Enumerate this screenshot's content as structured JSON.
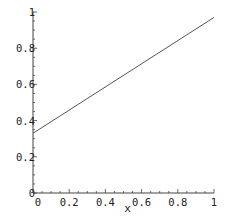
{
  "chart_data": {
    "type": "line",
    "title": "",
    "xlabel": "x",
    "ylabel": "",
    "xlim": [
      0,
      1
    ],
    "ylim": [
      0,
      1
    ],
    "grid": false,
    "legend": null,
    "x_ticks": [
      "0",
      "0.2",
      "0.4",
      "0.6",
      "0.8",
      "1"
    ],
    "y_ticks": [
      "0",
      "0.2",
      "0.4",
      "0.6",
      "0.8",
      "1"
    ],
    "series": [
      {
        "name": "line",
        "x": [
          0,
          1
        ],
        "y": [
          0.33,
          0.97
        ],
        "color": "#555555"
      }
    ]
  }
}
